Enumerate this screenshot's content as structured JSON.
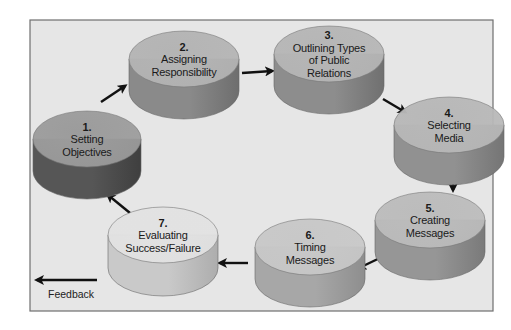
{
  "diagram": {
    "type": "cycle",
    "frame": {
      "x": 30,
      "y": 20,
      "w": 463,
      "h": 291,
      "fill": "#e6e6e6",
      "stroke": "#6f6f6f"
    },
    "steps": [
      {
        "number": "1.",
        "lines": [
          "Setting",
          "Objectives"
        ],
        "cx": 87,
        "cy": 139,
        "rx": 54,
        "ry": 28,
        "h": 32,
        "top": "#9c9c9c",
        "side": "#565656",
        "sideDark": "#3f3f3f"
      },
      {
        "number": "2.",
        "lines": [
          "Assigning",
          "Responsibility"
        ],
        "cx": 184,
        "cy": 59,
        "rx": 55,
        "ry": 28,
        "h": 32,
        "top": "#b4b4b4",
        "side": "#8a8a8a",
        "sideDark": "#6e6e6e"
      },
      {
        "number": "3.",
        "lines": [
          "Outlining Types",
          "of Public",
          "Relations"
        ],
        "cx": 329,
        "cy": 54,
        "rx": 55,
        "ry": 28,
        "h": 32,
        "top": "#b6b6b6",
        "side": "#8d8d8d",
        "sideDark": "#707070"
      },
      {
        "number": "4.",
        "lines": [
          "Selecting",
          "Media"
        ],
        "cx": 449,
        "cy": 125,
        "rx": 55,
        "ry": 28,
        "h": 32,
        "top": "#b8b8b8",
        "side": "#919191",
        "sideDark": "#757575"
      },
      {
        "number": "5.",
        "lines": [
          "Creating",
          "Messages"
        ],
        "cx": 430,
        "cy": 220,
        "rx": 55,
        "ry": 28,
        "h": 32,
        "top": "#bcbcbc",
        "side": "#969696",
        "sideDark": "#7a7a7a"
      },
      {
        "number": "6.",
        "lines": [
          "Timing",
          "Messages"
        ],
        "cx": 310,
        "cy": 247,
        "rx": 55,
        "ry": 28,
        "h": 32,
        "top": "#c8c8c8",
        "side": "#a7a7a7",
        "sideDark": "#8e8e8e"
      },
      {
        "number": "7.",
        "lines": [
          "Evaluating",
          "Success/Failure"
        ],
        "cx": 163,
        "cy": 235,
        "rx": 55,
        "ry": 28,
        "h": 33,
        "top": "#e2e2e2",
        "side": "#c9c9c9",
        "sideDark": "#adadad"
      }
    ],
    "arrows": [
      {
        "from": "1",
        "to": "2",
        "x1": 101,
        "y1": 102,
        "x2": 125,
        "y2": 86
      },
      {
        "from": "2",
        "to": "3",
        "x1": 242,
        "y1": 73,
        "x2": 272,
        "y2": 71
      },
      {
        "from": "3",
        "to": "4",
        "x1": 383,
        "y1": 99,
        "x2": 405,
        "y2": 112
      },
      {
        "from": "4",
        "to": "5",
        "x1": 453,
        "y1": 162,
        "x2": 453,
        "y2": 190
      },
      {
        "from": "5",
        "to": "6",
        "x1": 384,
        "y1": 256,
        "x2": 359,
        "y2": 268
      },
      {
        "from": "6",
        "to": "7",
        "x1": 248,
        "y1": 263,
        "x2": 220,
        "y2": 263
      },
      {
        "from": "7",
        "to": "1",
        "x1": 130,
        "y1": 213,
        "x2": 108,
        "y2": 195
      }
    ],
    "feedback": {
      "label": "Feedback",
      "x1": 97,
      "y1": 280,
      "x2": 37,
      "y2": 280,
      "label_x": 48,
      "label_y": 298
    }
  }
}
